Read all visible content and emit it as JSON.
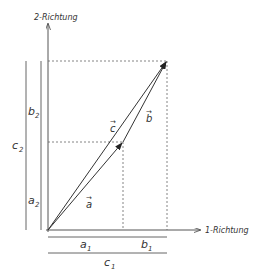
{
  "axes": {
    "x_label": "1-Richtung",
    "y_label": "2-Richtung"
  },
  "vectors": {
    "a": "a",
    "b": "b",
    "c": "c"
  },
  "components": {
    "a1": "a",
    "a1_sub": "1",
    "b1": "b",
    "b1_sub": "1",
    "c1": "c",
    "c1_sub": "1",
    "a2": "a",
    "a2_sub": "2",
    "b2": "b",
    "b2_sub": "2",
    "c2": "c",
    "c2_sub": "2"
  },
  "colors": {
    "line": "#444444",
    "dashed": "#666666"
  }
}
